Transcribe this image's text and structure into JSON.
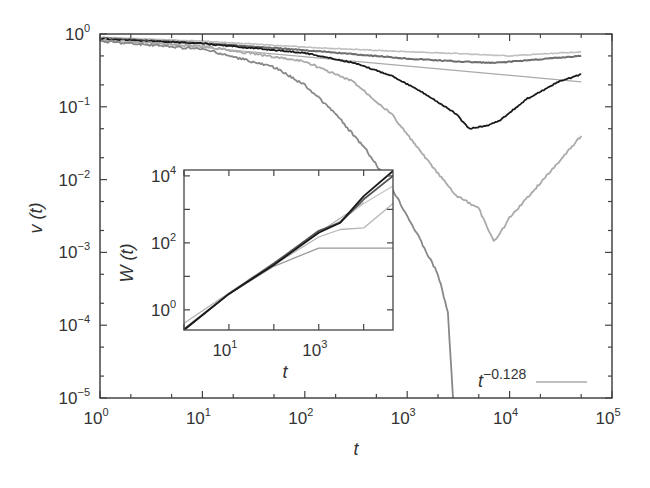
{
  "chart_data": [
    {
      "id": "main",
      "type": "line",
      "title": "",
      "xlabel": "t",
      "ylabel": "v (t)",
      "xscale": "log",
      "yscale": "log",
      "xlim": [
        1,
        100000
      ],
      "ylim": [
        1e-05,
        1
      ],
      "grid": false,
      "x_ticks": [
        {
          "base": "10",
          "exp": "0"
        },
        {
          "base": "10",
          "exp": "1"
        },
        {
          "base": "10",
          "exp": "2"
        },
        {
          "base": "10",
          "exp": "3"
        },
        {
          "base": "10",
          "exp": "4"
        },
        {
          "base": "10",
          "exp": "5"
        }
      ],
      "y_ticks": [
        {
          "base": "10",
          "exp": "0"
        },
        {
          "base": "10",
          "exp": "−1"
        },
        {
          "base": "10",
          "exp": "−2"
        },
        {
          "base": "10",
          "exp": "−3"
        },
        {
          "base": "10",
          "exp": "−4"
        },
        {
          "base": "10",
          "exp": "−5"
        }
      ],
      "legend": {
        "position": "lower right",
        "entries": [
          {
            "label_base": "t",
            "label_exp": "−0.128",
            "color": "#aaaaaa"
          }
        ]
      },
      "series": [
        {
          "name": "curve-top-light",
          "color": "#c0c0c0",
          "width": 1.6,
          "x": [
            1,
            10,
            100,
            1000,
            3000,
            10000,
            50000
          ],
          "y": [
            0.9,
            0.8,
            0.66,
            0.57,
            0.54,
            0.5,
            0.57
          ]
        },
        {
          "name": "curve-dark-upper",
          "color": "#6e6e6e",
          "width": 2,
          "x": [
            1,
            10,
            100,
            1000,
            3000,
            7000,
            20000,
            50000
          ],
          "y": [
            0.88,
            0.75,
            0.6,
            0.46,
            0.42,
            0.4,
            0.45,
            0.5
          ]
        },
        {
          "name": "power-law-fit",
          "color": "#aaaaaa",
          "width": 1.2,
          "x": [
            1,
            50000
          ],
          "y": [
            0.88,
            0.22
          ]
        },
        {
          "name": "curve-black-dip",
          "color": "#1a1a1a",
          "width": 1.8,
          "x": [
            1,
            10,
            100,
            300,
            700,
            1500,
            3000,
            4000,
            6000,
            8000,
            15000,
            30000,
            50000
          ],
          "y": [
            0.85,
            0.74,
            0.55,
            0.4,
            0.27,
            0.15,
            0.08,
            0.05,
            0.055,
            0.065,
            0.13,
            0.22,
            0.28
          ]
        },
        {
          "name": "curve-gray-deep-dip",
          "color": "#aaaaaa",
          "width": 1.8,
          "x": [
            1,
            10,
            100,
            300,
            700,
            1500,
            3000,
            5000,
            7000,
            8000,
            10000,
            20000,
            50000
          ],
          "y": [
            0.82,
            0.68,
            0.42,
            0.22,
            0.08,
            0.02,
            0.006,
            0.004,
            0.0014,
            0.0018,
            0.003,
            0.009,
            0.04
          ]
        },
        {
          "name": "curve-gray-collapse",
          "color": "#888888",
          "width": 1.8,
          "x": [
            1,
            10,
            50,
            100,
            200,
            400,
            700,
            1200,
            2000,
            2500,
            2800
          ],
          "y": [
            0.8,
            0.62,
            0.35,
            0.2,
            0.08,
            0.025,
            0.008,
            0.002,
            0.0005,
            0.00015,
            1e-05
          ]
        }
      ]
    },
    {
      "id": "inset",
      "type": "line",
      "title": "",
      "xlabel": "t",
      "ylabel": "W (t)",
      "xscale": "log",
      "yscale": "log",
      "xlim": [
        1,
        45000
      ],
      "ylim": [
        0.25,
        15000
      ],
      "grid": false,
      "x_ticks": [
        {
          "base": "10",
          "exp": "1"
        },
        {
          "base": "10",
          "exp": "3"
        }
      ],
      "y_ticks": [
        {
          "base": "10",
          "exp": "0"
        },
        {
          "base": "10",
          "exp": "2"
        },
        {
          "base": "10",
          "exp": "4"
        }
      ],
      "series": [
        {
          "name": "inset-reference-line",
          "color": "#b0b0b0",
          "width": 1.2,
          "x": [
            1,
            10000
          ],
          "y": [
            0.4,
            1600
          ]
        },
        {
          "name": "inset-plateau-low",
          "color": "#9a9a9a",
          "width": 1.3,
          "x": [
            1,
            10,
            100,
            1000,
            45000
          ],
          "y": [
            0.25,
            3,
            20,
            70,
            70
          ]
        },
        {
          "name": "inset-plateau-mid",
          "color": "#b5b5b5",
          "width": 1.3,
          "x": [
            1,
            10,
            100,
            1000,
            3000,
            10000,
            20000,
            45000
          ],
          "y": [
            0.26,
            3,
            22,
            150,
            250,
            280,
            600,
            1500
          ]
        },
        {
          "name": "inset-curve-light",
          "color": "#c5c5c5",
          "width": 1.3,
          "x": [
            1,
            10,
            100,
            1000,
            3000,
            10000,
            45000
          ],
          "y": [
            0.27,
            3.1,
            23,
            200,
            450,
            1500,
            5000
          ]
        },
        {
          "name": "inset-curve-dark",
          "color": "#555555",
          "width": 1.8,
          "x": [
            1,
            10,
            100,
            1000,
            3000,
            10000,
            45000
          ],
          "y": [
            0.26,
            3,
            24,
            230,
            400,
            2000,
            10000
          ]
        },
        {
          "name": "inset-curve-black",
          "color": "#1a1a1a",
          "width": 1.8,
          "x": [
            1,
            10,
            100,
            1000,
            3000,
            10000,
            45000
          ],
          "y": [
            0.25,
            3,
            22,
            200,
            400,
            2500,
            14000
          ]
        }
      ]
    }
  ]
}
